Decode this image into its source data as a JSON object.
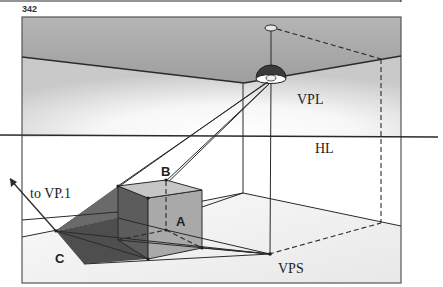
{
  "page_number": "342",
  "labels": {
    "vanishing_point_light": "VPL",
    "horizon_line": "HL",
    "vanishing_point_shadow": "VPS",
    "to_vp1": "to VP.1",
    "point_a": "A",
    "point_b": "B",
    "point_c": "C"
  },
  "colors": {
    "ceiling": "#a9a9a9",
    "wall_light": "#e6e6e6",
    "floor": "#f4f4f4",
    "cube_dark_face": "#5a5a5a",
    "cube_light_face": "#a8a8a8",
    "cube_top": "#c4c4c4",
    "shadow": "#505050",
    "lamp_shade": "#3a3a3a",
    "line": "#2a2a2a"
  }
}
